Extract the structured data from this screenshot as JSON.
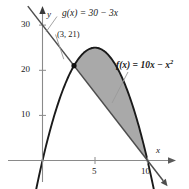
{
  "chart_data": {
    "type": "line",
    "title": "",
    "xlabel": "x",
    "ylabel": "y",
    "xlim": [
      -1.2,
      12.2
    ],
    "ylim": [
      -6,
      33
    ],
    "grid": false,
    "legend": "none",
    "xticks": [
      5,
      10
    ],
    "xtick_labels": [
      "5",
      "10"
    ],
    "yticks": [
      10,
      20,
      30
    ],
    "ytick_labels": [
      "10",
      "20",
      "30"
    ],
    "series": [
      {
        "name": "f",
        "label": "f(x) = 10x - x^2",
        "expression": "10x - x^2",
        "type": "parabola",
        "a": -1,
        "b": 10,
        "c": 0,
        "roots": [
          0,
          10
        ],
        "vertex": [
          5,
          25
        ],
        "color": "#1a1a1a"
      },
      {
        "name": "g",
        "label": "g(x) = 30 - 3x",
        "expression": "30 - 3x",
        "type": "line",
        "slope": -3,
        "intercept": 30,
        "color": "#555555"
      }
    ],
    "intersections": [
      {
        "x": 3,
        "y": 21,
        "label": "(3, 21)"
      },
      {
        "x": 10,
        "y": 0,
        "label": ""
      }
    ],
    "shaded_region": {
      "description": "area between f(x) and g(x) from x=3 to x=10",
      "from_x": 3,
      "to_x": 10,
      "upper": "f",
      "lower": "g",
      "fill_color": "#a9a9a9"
    }
  },
  "labels": {
    "g_function": "g(x) = 30 − 3x",
    "f_function_lead": "f(x) = 10x − x",
    "f_function_exp": "2",
    "point": "(3, 21)",
    "y_axis": "y",
    "x_axis": "x",
    "ytick_30": "30",
    "ytick_20": "20",
    "ytick_10": "10",
    "xtick_5": "5",
    "xtick_10": "10"
  },
  "colors": {
    "curve": "#1a1a1a",
    "line": "#4d4d4d",
    "axis": "#808080",
    "fill": "#a9a9a9",
    "leader": "#9a9a9a",
    "text": "#1a1a1a"
  }
}
